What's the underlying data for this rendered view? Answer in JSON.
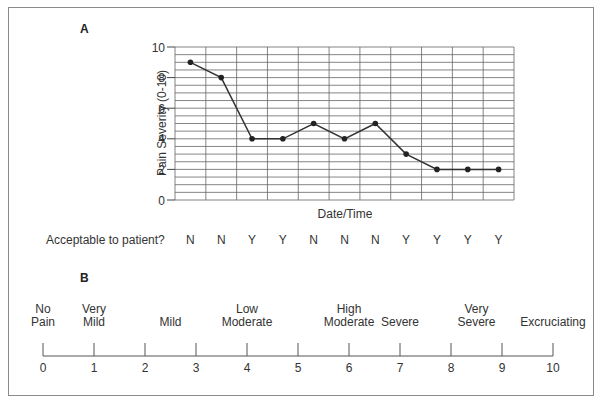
{
  "chart_data": {
    "type": "line",
    "title": "A",
    "xlabel": "Date/Time",
    "ylabel": "Pain Severity (0-10)",
    "ylim": [
      0,
      10
    ],
    "yticks": [
      0,
      2,
      4,
      6,
      8,
      10
    ],
    "grid": {
      "horizontal_step": 0.5,
      "vertical": true
    },
    "x": [
      1,
      2,
      3,
      4,
      5,
      6,
      7,
      8,
      9,
      10,
      11
    ],
    "series": [
      {
        "name": "Pain Severity",
        "values": [
          9,
          8,
          4,
          4,
          5,
          4,
          5,
          3,
          2,
          2,
          2
        ]
      }
    ],
    "row_label": "Acceptable to patient?",
    "acceptable": [
      "N",
      "N",
      "Y",
      "Y",
      "N",
      "N",
      "N",
      "Y",
      "Y",
      "Y",
      "Y"
    ],
    "scale": {
      "title": "B",
      "type": "numeric_rating_scale",
      "ticks": [
        0,
        1,
        2,
        3,
        4,
        5,
        6,
        7,
        8,
        9,
        10
      ],
      "descriptors": [
        {
          "line1": "No",
          "line2": "Pain",
          "at": 0
        },
        {
          "line1": "Very",
          "line2": "Mild",
          "at": 1
        },
        {
          "line1": "",
          "line2": "Mild",
          "at": 2.5
        },
        {
          "line1": "Low",
          "line2": "Moderate",
          "at": 4
        },
        {
          "line1": "High",
          "line2": "Moderate",
          "at": 6
        },
        {
          "line1": "",
          "line2": "Severe",
          "at": 7
        },
        {
          "line1": "Very",
          "line2": "Severe",
          "at": 8.5
        },
        {
          "line1": "",
          "line2": "Excruciating",
          "at": 10
        }
      ]
    }
  },
  "labels": {
    "panel_a": "A",
    "panel_b": "B",
    "ylabel": "Pain Severity (0-10)",
    "xlabel": "Date/Time",
    "acceptable_row": "Acceptable to patient?"
  },
  "colors": {
    "line": "#333333",
    "grid": "#666666",
    "frame": "#8a8a8a",
    "text": "#333333"
  }
}
